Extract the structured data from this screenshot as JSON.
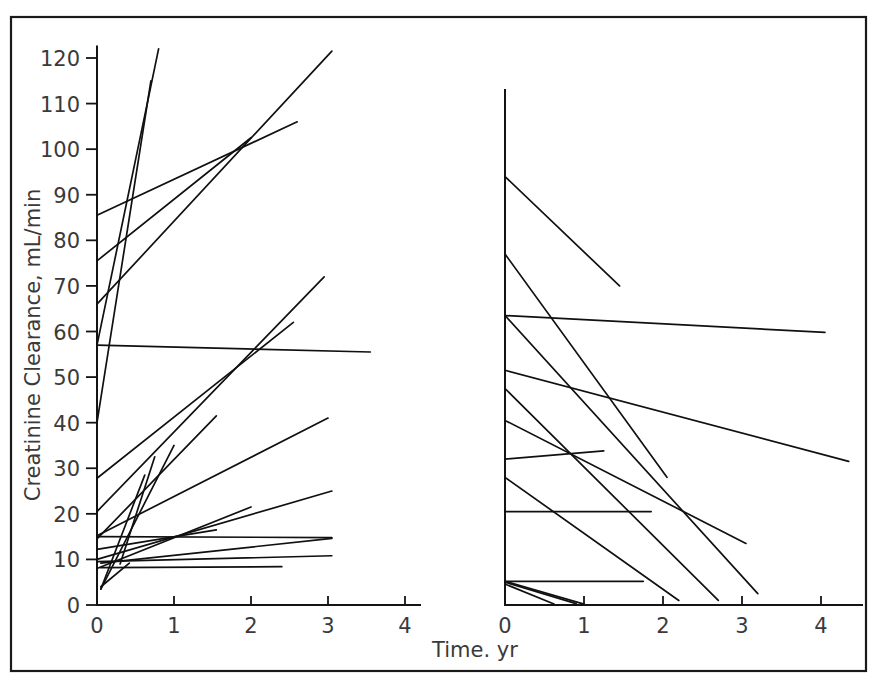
{
  "figure": {
    "background_color": "#ffffff",
    "line_color": "#101010",
    "text_color": "#3a3a3a",
    "border_color": "#1a1a1a"
  },
  "chart_data": {
    "type": "line",
    "title": "",
    "subtitle": "",
    "xlabel": "Time. yr",
    "ylabel": "Creatinine Clearance, mL/min",
    "grid": false,
    "legend": "none",
    "ylim": [
      0,
      125
    ],
    "ytick_values": [
      0,
      10,
      20,
      30,
      40,
      50,
      60,
      70,
      80,
      90,
      100,
      110,
      120
    ],
    "ytick_labels": [
      "0",
      "10",
      "20",
      "30",
      "40",
      "50",
      "60",
      "70",
      "80",
      "90",
      "100",
      "110",
      "120"
    ],
    "panels": [
      {
        "name": "left-panel-improving",
        "xlim": [
          0,
          4.4
        ],
        "xtick_values": [
          0,
          1,
          2,
          3,
          4
        ],
        "xtick_labels": [
          "0",
          "1",
          "2",
          "3",
          "4"
        ],
        "series": [
          {
            "name": "subject-L01",
            "x": [
              0.0,
              0.8
            ],
            "y": [
              57.0,
              122.0
            ]
          },
          {
            "name": "subject-L02",
            "x": [
              0.0,
              0.7
            ],
            "y": [
              40.0,
              115.0
            ]
          },
          {
            "name": "subject-L03",
            "x": [
              0.0,
              3.05
            ],
            "y": [
              66.0,
              121.5
            ]
          },
          {
            "name": "subject-L04",
            "x": [
              0.0,
              2.0
            ],
            "y": [
              75.5,
              102.5
            ]
          },
          {
            "name": "subject-L05",
            "x": [
              0.0,
              2.6
            ],
            "y": [
              85.5,
              106.0
            ]
          },
          {
            "name": "subject-L06",
            "x": [
              0.0,
              3.55
            ],
            "y": [
              57.0,
              55.5
            ]
          },
          {
            "name": "subject-L07",
            "x": [
              0.0,
              2.95
            ],
            "y": [
              20.5,
              72.0
            ]
          },
          {
            "name": "subject-L08",
            "x": [
              0.0,
              2.55
            ],
            "y": [
              27.8,
              62.0
            ]
          },
          {
            "name": "subject-L09",
            "x": [
              0.0,
              1.55
            ],
            "y": [
              14.5,
              41.5
            ]
          },
          {
            "name": "subject-L10",
            "x": [
              0.0,
              3.0
            ],
            "y": [
              15.2,
              41.0
            ]
          },
          {
            "name": "subject-L11",
            "x": [
              0.3,
              0.75
            ],
            "y": [
              9.0,
              32.5
            ]
          },
          {
            "name": "subject-L12",
            "x": [
              0.05,
              0.62
            ],
            "y": [
              3.5,
              28.5
            ]
          },
          {
            "name": "subject-L13",
            "x": [
              0.0,
              3.05
            ],
            "y": [
              10.0,
              25.0
            ]
          },
          {
            "name": "subject-L14",
            "x": [
              0.0,
              2.0
            ],
            "y": [
              8.0,
              21.5
            ]
          },
          {
            "name": "subject-L15",
            "x": [
              0.0,
              1.55
            ],
            "y": [
              12.2,
              16.5
            ]
          },
          {
            "name": "subject-L16",
            "x": [
              0.0,
              3.05
            ],
            "y": [
              15.0,
              14.8
            ]
          },
          {
            "name": "subject-L17",
            "x": [
              0.05,
              3.05
            ],
            "y": [
              9.2,
              14.6
            ]
          },
          {
            "name": "subject-L18",
            "x": [
              0.0,
              3.05
            ],
            "y": [
              9.5,
              10.8
            ]
          },
          {
            "name": "subject-L19",
            "x": [
              0.05,
              2.4
            ],
            "y": [
              8.2,
              8.4
            ]
          },
          {
            "name": "subject-L20",
            "x": [
              0.05,
              1.0
            ],
            "y": [
              3.5,
              35.0
            ]
          },
          {
            "name": "subject-L21",
            "x": [
              0.05,
              0.42
            ],
            "y": [
              4.0,
              9.2
            ]
          }
        ]
      },
      {
        "name": "right-panel-declining",
        "xlim": [
          0,
          4.6
        ],
        "xtick_values": [
          0,
          1,
          2,
          3,
          4
        ],
        "xtick_labels": [
          "0",
          "1",
          "2",
          "3",
          "4"
        ],
        "axis_top_value": 113.0,
        "series": [
          {
            "name": "subject-R01",
            "x": [
              0.0,
              1.45
            ],
            "y": [
              94.0,
              70.0
            ]
          },
          {
            "name": "subject-R02",
            "x": [
              0.0,
              2.05
            ],
            "y": [
              77.0,
              28.0
            ]
          },
          {
            "name": "subject-R03",
            "x": [
              0.0,
              4.05
            ],
            "y": [
              63.5,
              59.8
            ]
          },
          {
            "name": "subject-R04",
            "x": [
              0.0,
              3.2
            ],
            "y": [
              63.5,
              2.5
            ]
          },
          {
            "name": "subject-R05",
            "x": [
              0.0,
              4.35
            ],
            "y": [
              51.5,
              31.5
            ]
          },
          {
            "name": "subject-R06",
            "x": [
              0.0,
              2.7
            ],
            "y": [
              47.5,
              1.0
            ]
          },
          {
            "name": "subject-R07",
            "x": [
              0.0,
              3.05
            ],
            "y": [
              40.5,
              13.5
            ]
          },
          {
            "name": "subject-R08",
            "x": [
              0.0,
              1.25
            ],
            "y": [
              32.0,
              33.8
            ]
          },
          {
            "name": "subject-R09",
            "x": [
              0.0,
              2.2
            ],
            "y": [
              28.0,
              1.0
            ]
          },
          {
            "name": "subject-R10",
            "x": [
              0.0,
              1.85
            ],
            "y": [
              20.5,
              20.5
            ]
          },
          {
            "name": "subject-R11",
            "x": [
              0.0,
              1.75
            ],
            "y": [
              5.2,
              5.2
            ]
          },
          {
            "name": "subject-R12",
            "x": [
              0.0,
              1.0
            ],
            "y": [
              5.2,
              0.2
            ]
          },
          {
            "name": "subject-R13",
            "x": [
              0.0,
              0.9
            ],
            "y": [
              5.0,
              0.3
            ]
          },
          {
            "name": "subject-R14",
            "x": [
              0.0,
              0.62
            ],
            "y": [
              4.6,
              0.2
            ]
          }
        ]
      }
    ]
  }
}
